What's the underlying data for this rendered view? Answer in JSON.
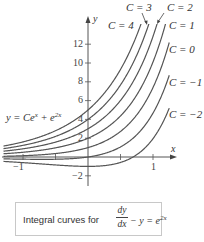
{
  "chart_data": {
    "type": "line",
    "equation": "y = Ce^x + e^{2x}",
    "xlabel": "x",
    "ylabel": "y",
    "xlim": [
      -1.3,
      1.25
    ],
    "ylim": [
      -2.5,
      14
    ],
    "x_ticks": [
      -1,
      -0.5,
      0,
      0.5,
      1
    ],
    "x_tick_labels": {
      "-1": "−1",
      "1": "1"
    },
    "y_ticks": [
      -2,
      2,
      4,
      6,
      8,
      10,
      12
    ],
    "y_tick_labels": [
      "−2",
      "2",
      "4",
      "6",
      "8",
      "10",
      "12"
    ],
    "grid": false,
    "series": [
      {
        "name": "C = 4",
        "C": 4
      },
      {
        "name": "C = 3",
        "C": 3
      },
      {
        "name": "C = 2",
        "C": 2
      },
      {
        "name": "C = 1",
        "C": 1
      },
      {
        "name": "C = 0",
        "C": 0
      },
      {
        "name": "C = -1",
        "C": -1
      },
      {
        "name": "C = -2",
        "C": -2
      }
    ],
    "annotations": [
      {
        "text": "C = 4",
        "near_curve": 4
      },
      {
        "text": "C = 3",
        "near_curve": 3,
        "arrow": true
      },
      {
        "text": "C = 2",
        "near_curve": 2,
        "arrow": true
      },
      {
        "text": "C = 1",
        "near_curve": 1
      },
      {
        "text": "C = 0",
        "near_curve": 0
      },
      {
        "text": "C = −1",
        "near_curve": -1
      },
      {
        "text": "C = −2",
        "near_curve": -2
      },
      {
        "text": "y = Ce^x + e^{2x}",
        "position": "left"
      }
    ]
  },
  "labels": {
    "axis_x": "x",
    "axis_y": "y",
    "c4": "C = 4",
    "c3": "C = 3",
    "c2": "C = 2",
    "c1": "C = 1",
    "c0": "C = 0",
    "cm1": "C = −1",
    "cm2": "C = −2",
    "equation_prefix": "y = Ce",
    "equation_exp1": "x",
    "equation_mid": " + e",
    "equation_exp2": "2x"
  },
  "caption": {
    "prefix": "Integral curves for",
    "frac_num": "dy",
    "frac_den": "dx",
    "rest": " − y = e",
    "rest_exp": "2x"
  },
  "colors": {
    "curve": "#555555",
    "axis": "#555555",
    "text": "#333333",
    "box_border": "#c8c8c8"
  }
}
